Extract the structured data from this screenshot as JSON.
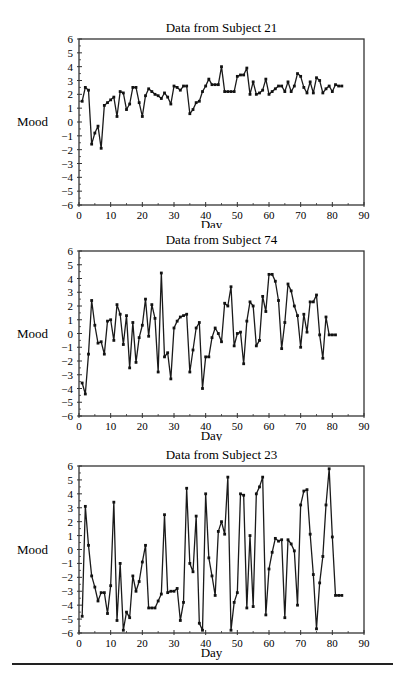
{
  "figure": {
    "charts": [
      {
        "id": "subject-21",
        "title": "Data from Subject 21",
        "xlabel": "Day",
        "ylabel": "Mood"
      },
      {
        "id": "subject-74",
        "title": "Data from Subject 74",
        "xlabel": "Day",
        "ylabel": "Mood"
      },
      {
        "id": "subject-23",
        "title": "Data from Subject 23",
        "xlabel": "Day",
        "ylabel": "Mood"
      }
    ]
  },
  "chart_data": [
    {
      "type": "line",
      "title": "Data from Subject 21",
      "xlabel": "Day",
      "ylabel": "Mood",
      "xlim": [
        0,
        90
      ],
      "ylim": [
        -6,
        6
      ],
      "xticks": [
        0,
        10,
        20,
        30,
        40,
        50,
        60,
        70,
        80,
        90
      ],
      "yticks": [
        6,
        5,
        4,
        3,
        2,
        1,
        0,
        -1,
        -2,
        -3,
        -4,
        -5,
        -6
      ],
      "grid": false,
      "legend": null,
      "markers": true,
      "x": [
        1,
        2,
        3,
        4,
        5,
        6,
        7,
        8,
        9,
        10,
        11,
        12,
        13,
        14,
        15,
        16,
        17,
        18,
        19,
        20,
        21,
        22,
        23,
        24,
        25,
        26,
        27,
        28,
        29,
        30,
        31,
        32,
        33,
        34,
        35,
        36,
        37,
        38,
        39,
        40,
        41,
        42,
        43,
        44,
        45,
        46,
        47,
        48,
        49,
        50,
        51,
        52,
        53,
        54,
        55,
        56,
        57,
        58,
        59,
        60,
        61,
        62,
        63,
        64,
        65,
        66,
        67,
        68,
        69,
        70,
        71,
        72,
        73,
        74,
        75,
        76,
        77,
        78,
        79,
        80,
        81,
        82,
        83
      ],
      "series": [
        {
          "name": "Subject 21",
          "values": [
            1.5,
            2.5,
            2.3,
            -1.6,
            -0.8,
            -0.3,
            -1.9,
            1.2,
            1.4,
            1.6,
            1.8,
            0.4,
            2.2,
            2.1,
            0.9,
            1.3,
            2.5,
            2.5,
            1.4,
            0.4,
            1.9,
            2.4,
            2.2,
            2.0,
            1.9,
            1.7,
            2.1,
            1.8,
            1.3,
            2.6,
            2.5,
            2.3,
            2.6,
            2.6,
            0.6,
            0.9,
            1.4,
            1.5,
            2.2,
            2.6,
            3.1,
            2.7,
            2.7,
            2.7,
            4.0,
            2.2,
            2.2,
            2.2,
            2.2,
            3.3,
            3.4,
            3.4,
            3.9,
            2.0,
            2.9,
            2.0,
            2.1,
            2.3,
            3.1,
            2.0,
            2.2,
            2.4,
            2.6,
            2.6,
            2.2,
            2.9,
            2.2,
            2.6,
            3.5,
            3.3,
            2.5,
            2.1,
            2.9,
            2.1,
            3.2,
            3.0,
            2.1,
            2.4,
            2.6,
            2.2,
            2.7,
            2.6,
            2.6
          ]
        }
      ]
    },
    {
      "type": "line",
      "title": "Data from Subject 74",
      "xlabel": "Day",
      "ylabel": "Mood",
      "xlim": [
        0,
        90
      ],
      "ylim": [
        -6,
        6
      ],
      "xticks": [
        0,
        10,
        20,
        30,
        40,
        50,
        60,
        70,
        80,
        90
      ],
      "yticks": [
        6,
        5,
        4,
        3,
        2,
        1,
        0,
        -1,
        -2,
        -3,
        -4,
        -5,
        -6
      ],
      "grid": false,
      "legend": null,
      "markers": true,
      "x": [
        1,
        2,
        3,
        4,
        5,
        6,
        7,
        8,
        9,
        10,
        11,
        12,
        13,
        14,
        15,
        16,
        17,
        18,
        19,
        20,
        21,
        22,
        23,
        24,
        25,
        26,
        27,
        28,
        29,
        30,
        31,
        32,
        33,
        34,
        35,
        36,
        37,
        38,
        39,
        40,
        41,
        42,
        43,
        44,
        45,
        46,
        47,
        48,
        49,
        50,
        51,
        52,
        53,
        54,
        55,
        56,
        57,
        58,
        59,
        60,
        61,
        62,
        63,
        64,
        65,
        66,
        67,
        68,
        69,
        70,
        71,
        72,
        73,
        74,
        75,
        76,
        77,
        78,
        79,
        80,
        81
      ],
      "series": [
        {
          "name": "Subject 74",
          "values": [
            -3.6,
            -4.4,
            -1.5,
            2.4,
            0.6,
            -0.7,
            -0.6,
            -1.5,
            0.9,
            1.0,
            -0.5,
            2.1,
            1.4,
            -0.8,
            1.3,
            -2.5,
            0.8,
            -2.1,
            -0.3,
            0.6,
            2.5,
            -0.2,
            2.1,
            1.1,
            -2.8,
            4.4,
            -1.7,
            -1.4,
            -3.3,
            0.4,
            0.9,
            1.2,
            1.3,
            1.4,
            -2.8,
            -1.2,
            0.4,
            0.8,
            -4.0,
            -1.7,
            -1.7,
            -0.3,
            0.4,
            0.0,
            -0.6,
            2.2,
            2.0,
            3.4,
            -0.9,
            0.0,
            0.1,
            -2.2,
            0.9,
            2.3,
            2.0,
            -0.9,
            -0.5,
            2.7,
            1.6,
            4.3,
            4.3,
            3.8,
            2.4,
            -1.1,
            0.8,
            3.6,
            3.1,
            2.0,
            1.3,
            -1.0,
            1.4,
            0.1,
            2.3,
            2.3,
            2.8,
            -0.1,
            -1.8,
            1.2,
            -0.1,
            -0.1,
            -0.1
          ]
        }
      ]
    },
    {
      "type": "line",
      "title": "Data from Subject 23",
      "xlabel": "Day",
      "ylabel": "Mood",
      "xlim": [
        0,
        90
      ],
      "ylim": [
        -6,
        6
      ],
      "xticks": [
        0,
        10,
        20,
        30,
        40,
        50,
        60,
        70,
        80,
        90
      ],
      "yticks": [
        6,
        5,
        4,
        3,
        2,
        1,
        0,
        -1,
        -2,
        -3,
        -4,
        -5,
        -6
      ],
      "grid": false,
      "legend": null,
      "markers": true,
      "x": [
        1,
        2,
        3,
        4,
        5,
        6,
        7,
        8,
        9,
        10,
        11,
        12,
        13,
        14,
        15,
        16,
        17,
        18,
        19,
        20,
        21,
        22,
        23,
        24,
        25,
        26,
        27,
        28,
        29,
        30,
        31,
        32,
        33,
        34,
        35,
        36,
        37,
        38,
        39,
        40,
        41,
        42,
        43,
        44,
        45,
        46,
        47,
        48,
        49,
        50,
        51,
        52,
        53,
        54,
        55,
        56,
        57,
        58,
        59,
        60,
        61,
        62,
        63,
        64,
        65,
        66,
        67,
        68,
        69,
        70,
        71,
        72,
        73,
        74,
        75,
        76,
        77,
        78,
        79,
        80,
        81,
        82,
        83
      ],
      "series": [
        {
          "name": "Subject 23",
          "values": [
            -4.8,
            3.1,
            0.3,
            -1.9,
            -2.7,
            -3.7,
            -3.1,
            -3.1,
            -4.6,
            -2.6,
            3.4,
            -5.1,
            -1.0,
            -5.8,
            -4.5,
            -4.9,
            -1.9,
            -3.0,
            -2.3,
            -0.9,
            0.3,
            -4.2,
            -4.2,
            -4.2,
            -3.7,
            -3.2,
            2.5,
            -3.1,
            -3.0,
            -3.0,
            -2.8,
            -5.1,
            -3.8,
            4.4,
            -1.0,
            -1.6,
            2.4,
            -5.3,
            -5.8,
            4.0,
            -0.6,
            -1.9,
            -3.3,
            1.3,
            2.0,
            1.1,
            5.2,
            -5.8,
            -3.8,
            -3.1,
            4.0,
            3.9,
            -4.2,
            1.0,
            -4.1,
            4.0,
            4.5,
            5.2,
            -4.7,
            -1.4,
            -0.2,
            0.8,
            0.6,
            0.7,
            -4.9,
            0.7,
            0.4,
            -0.1,
            -4.0,
            3.2,
            4.2,
            4.3,
            1.1,
            -1.8,
            -5.7,
            -2.4,
            -0.5,
            3.2,
            5.8,
            0.9,
            -3.3,
            -3.3,
            -3.3
          ]
        }
      ]
    }
  ]
}
